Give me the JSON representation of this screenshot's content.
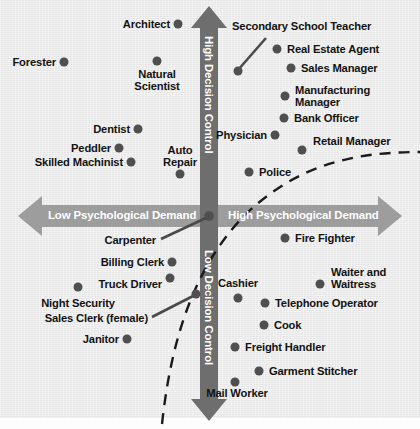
{
  "figure": {
    "background_color": "#ebebeb",
    "dot_color": "#4f4f4f",
    "axis_arrow_dark": "#6f6f6f",
    "axis_arrow_light": "#9a9a9a",
    "label_color": "#131313",
    "axis_label_color": "#ffffff"
  },
  "axes": {
    "vertical_top": "High Decision Control",
    "vertical_bottom": "Low Decision Control",
    "horizontal_left": "Low Psychological Demand",
    "horizontal_right": "High Psychological Demand"
  },
  "chart_data": {
    "type": "scatter",
    "title": "",
    "xlabel": "Psychological Demand",
    "ylabel": "Decision Control",
    "xlim": [
      -1,
      1
    ],
    "ylim": [
      -1,
      1
    ],
    "grid": false,
    "legend": "none",
    "annotations": [
      "Diagonal dashed curve separating active/passive strain region"
    ],
    "points": [
      {
        "label": "Architect",
        "x": 178,
        "y": 24,
        "lx": 170,
        "ly": 24,
        "align": "r"
      },
      {
        "label": "Forester",
        "x": 64,
        "y": 62,
        "lx": 56,
        "ly": 62,
        "align": "r"
      },
      {
        "label": "Natural\nScientist",
        "x": 157,
        "y": 61,
        "lx": 157,
        "ly": 80,
        "align": "c"
      },
      {
        "label": "Dentist",
        "x": 138,
        "y": 129,
        "lx": 130,
        "ly": 129,
        "align": "r"
      },
      {
        "label": "Peddler",
        "x": 119,
        "y": 148,
        "lx": 111,
        "ly": 148,
        "align": "r"
      },
      {
        "label": "Skilled Machinist",
        "x": 131,
        "y": 162,
        "lx": 123,
        "ly": 162,
        "align": "r"
      },
      {
        "label": "Auto\nRepair",
        "x": 180,
        "y": 174,
        "lx": 180,
        "ly": 156,
        "align": "c"
      },
      {
        "label": "Secondary School Teacher",
        "x": 238,
        "y": 71,
        "lx": 232,
        "ly": 26,
        "align": "l",
        "leader": [
          266,
          38,
          238,
          70
        ]
      },
      {
        "label": "Real Estate Agent",
        "x": 277,
        "y": 49,
        "lx": 287,
        "ly": 49,
        "align": "l"
      },
      {
        "label": "Sales Manager",
        "x": 291,
        "y": 68,
        "lx": 301,
        "ly": 68,
        "align": "l"
      },
      {
        "label": "Manufacturing\nManager",
        "x": 285,
        "y": 96,
        "lx": 295,
        "ly": 96,
        "align": "l"
      },
      {
        "label": "Bank Officer",
        "x": 284,
        "y": 118,
        "lx": 294,
        "ly": 118,
        "align": "l"
      },
      {
        "label": "Physician",
        "x": 275,
        "y": 135,
        "lx": 267,
        "ly": 135,
        "align": "r"
      },
      {
        "label": "Retail Manager",
        "x": 302,
        "y": 150,
        "lx": 313,
        "ly": 141,
        "align": "l"
      },
      {
        "label": "Police",
        "x": 249,
        "y": 172,
        "lx": 259,
        "ly": 172,
        "align": "l"
      },
      {
        "label": "Carpenter",
        "x": 209,
        "y": 216,
        "lx": 156,
        "ly": 240,
        "align": "r",
        "leader": [
          161,
          239,
          208,
          217
        ]
      },
      {
        "label": "Billing Clerk",
        "x": 172,
        "y": 262,
        "lx": 164,
        "ly": 262,
        "align": "r"
      },
      {
        "label": "Truck Driver",
        "x": 170,
        "y": 278,
        "lx": 162,
        "ly": 284,
        "align": "r"
      },
      {
        "label": "Night Security",
        "x": 78,
        "y": 287,
        "lx": 78,
        "ly": 303,
        "align": "c"
      },
      {
        "label": "Sales Clerk (female)",
        "x": 196,
        "y": 294,
        "lx": 148,
        "ly": 318,
        "align": "r",
        "leader": [
          152,
          317,
          195,
          295
        ]
      },
      {
        "label": "Janitor",
        "x": 127,
        "y": 339,
        "lx": 119,
        "ly": 339,
        "align": "r"
      },
      {
        "label": "Fire Fighter",
        "x": 285,
        "y": 238,
        "lx": 295,
        "ly": 238,
        "align": "l"
      },
      {
        "label": "Waiter and\nWaitress",
        "x": 320,
        "y": 284,
        "lx": 331,
        "ly": 278,
        "align": "l"
      },
      {
        "label": "Cashier",
        "x": 238,
        "y": 298,
        "lx": 238,
        "ly": 283,
        "align": "c"
      },
      {
        "label": "Telephone Operator",
        "x": 265,
        "y": 303,
        "lx": 275,
        "ly": 303,
        "align": "l"
      },
      {
        "label": "Cook",
        "x": 264,
        "y": 325,
        "lx": 274,
        "ly": 325,
        "align": "l"
      },
      {
        "label": "Freight Handler",
        "x": 235,
        "y": 347,
        "lx": 245,
        "ly": 347,
        "align": "l"
      },
      {
        "label": "Garment Stitcher",
        "x": 259,
        "y": 371,
        "lx": 269,
        "ly": 371,
        "align": "l"
      },
      {
        "label": "Mail Worker",
        "x": 235,
        "y": 382,
        "lx": 237,
        "ly": 393,
        "align": "c"
      }
    ]
  }
}
